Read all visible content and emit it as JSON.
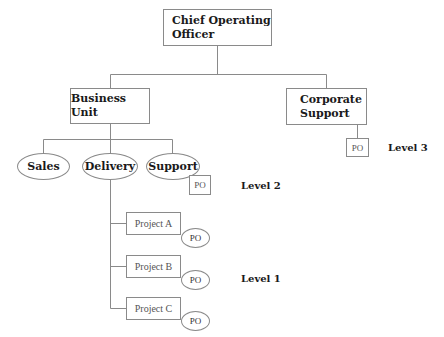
{
  "diagram": {
    "type": "org-chart",
    "root": {
      "label": "Chief Operating Officer",
      "line1": "Chief Operating",
      "line2": "Officer"
    },
    "level_2_units": [
      {
        "label": "Business Unit"
      },
      {
        "label": "Corporate Support",
        "line1": "Corporate",
        "line2": "Support",
        "po_label": "PO"
      }
    ],
    "business_unit_children": [
      {
        "label": "Sales"
      },
      {
        "label": "Delivery"
      },
      {
        "label": "Support",
        "po_label": "PO"
      }
    ],
    "projects": [
      {
        "label": "Project A",
        "po_label": "PO"
      },
      {
        "label": "Project B",
        "po_label": "PO"
      },
      {
        "label": "Project C",
        "po_label": "PO"
      }
    ],
    "levels": {
      "level3": "Level 3",
      "level2": "Level 2",
      "level1": "Level 1"
    },
    "colors": {
      "line": "#8a8a8a",
      "text": "#1a1a1a",
      "background": "#ffffff"
    }
  }
}
